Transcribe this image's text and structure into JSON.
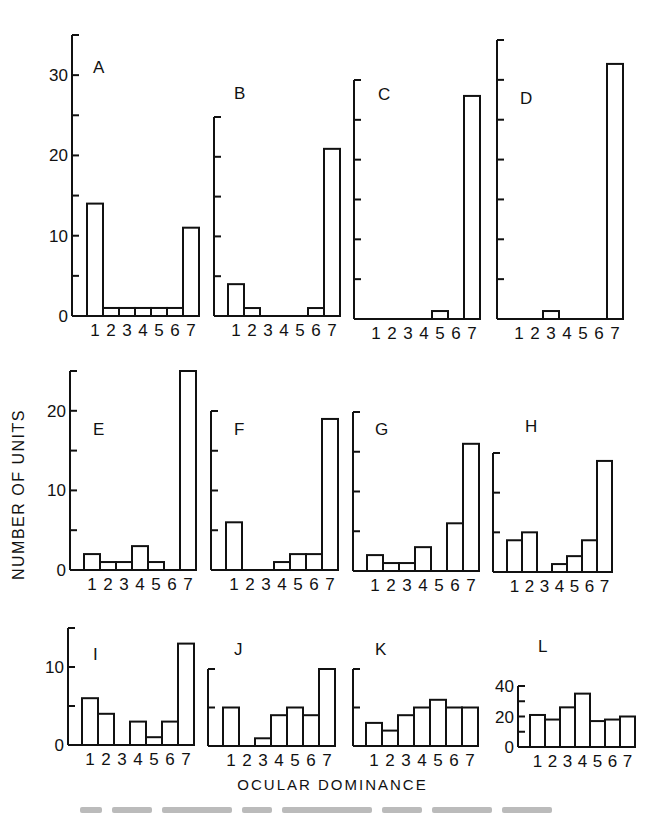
{
  "figure": {
    "y_axis_label": "NUMBER OF UNITS",
    "x_axis_label": "OCULAR DOMINANCE",
    "bar_fill": "#ffffff",
    "stroke": "#111111"
  },
  "chart_data": [
    {
      "panel": "A",
      "type": "bar",
      "categories": [
        "1",
        "2",
        "3",
        "4",
        "5",
        "6",
        "7"
      ],
      "values": [
        14,
        1,
        1,
        1,
        1,
        1,
        11
      ],
      "ylim": [
        0,
        35
      ],
      "yticks": [
        0,
        5,
        10,
        15,
        20,
        25,
        30,
        35
      ],
      "ytick_labels": [
        "0",
        "10",
        "20",
        "30"
      ],
      "xlabel": "OCULAR DOMINANCE",
      "ylabel": "NUMBER OF UNITS",
      "grid": false
    },
    {
      "panel": "B",
      "type": "bar",
      "categories": [
        "1",
        "2",
        "3",
        "4",
        "5",
        "6",
        "7"
      ],
      "values": [
        4,
        1,
        0,
        0,
        0,
        1,
        21
      ],
      "ylim": [
        0,
        25
      ],
      "yticks": [
        0,
        5,
        10,
        15,
        20,
        25
      ],
      "ytick_labels": [],
      "grid": false
    },
    {
      "panel": "C",
      "type": "bar",
      "categories": [
        "1",
        "2",
        "3",
        "4",
        "5",
        "6",
        "7"
      ],
      "values": [
        0,
        0,
        0,
        0,
        1,
        0,
        28
      ],
      "ylim": [
        0,
        30
      ],
      "yticks": [
        0,
        5,
        10,
        15,
        20,
        25,
        30
      ],
      "ytick_labels": [],
      "grid": false
    },
    {
      "panel": "D",
      "type": "bar",
      "categories": [
        "1",
        "2",
        "3",
        "4",
        "5",
        "6",
        "7"
      ],
      "values": [
        0,
        0,
        1,
        0,
        0,
        0,
        32
      ],
      "ylim": [
        0,
        35
      ],
      "yticks": [
        0,
        5,
        10,
        15,
        20,
        25,
        30,
        35
      ],
      "ytick_labels": [],
      "grid": false
    },
    {
      "panel": "E",
      "type": "bar",
      "categories": [
        "1",
        "2",
        "3",
        "4",
        "5",
        "6",
        "7"
      ],
      "values": [
        2,
        1,
        1,
        3,
        1,
        0,
        25
      ],
      "ylim": [
        0,
        25
      ],
      "yticks": [
        0,
        5,
        10,
        15,
        20,
        25
      ],
      "ytick_labels": [
        "0",
        "10",
        "20"
      ],
      "grid": false
    },
    {
      "panel": "F",
      "type": "bar",
      "categories": [
        "1",
        "2",
        "3",
        "4",
        "5",
        "6",
        "7"
      ],
      "values": [
        6,
        0,
        0,
        1,
        2,
        2,
        19
      ],
      "ylim": [
        0,
        20
      ],
      "yticks": [
        0,
        5,
        10,
        15,
        20
      ],
      "ytick_labels": [],
      "grid": false
    },
    {
      "panel": "G",
      "type": "bar",
      "categories": [
        "1",
        "2",
        "3",
        "4",
        "5",
        "6",
        "7"
      ],
      "values": [
        2,
        1,
        1,
        3,
        0,
        6,
        16
      ],
      "ylim": [
        0,
        20
      ],
      "yticks": [
        0,
        5,
        10,
        15,
        20
      ],
      "ytick_labels": [],
      "grid": false
    },
    {
      "panel": "H",
      "type": "bar",
      "categories": [
        "1",
        "2",
        "3",
        "4",
        "5",
        "6",
        "7"
      ],
      "values": [
        4,
        5,
        0,
        1,
        2,
        4,
        14
      ],
      "ylim": [
        0,
        15
      ],
      "yticks": [
        0,
        5,
        10,
        15
      ],
      "ytick_labels": [],
      "grid": false
    },
    {
      "panel": "I",
      "type": "bar",
      "categories": [
        "1",
        "2",
        "3",
        "4",
        "5",
        "6",
        "7"
      ],
      "values": [
        6,
        4,
        0,
        3,
        1,
        3,
        13
      ],
      "ylim": [
        0,
        15
      ],
      "yticks": [
        0,
        5,
        10,
        15
      ],
      "ytick_labels": [
        "0",
        "10"
      ],
      "grid": false
    },
    {
      "panel": "J",
      "type": "bar",
      "categories": [
        "1",
        "2",
        "3",
        "4",
        "5",
        "6",
        "7"
      ],
      "values": [
        5,
        0,
        1,
        4,
        5,
        4,
        10
      ],
      "ylim": [
        0,
        10
      ],
      "yticks": [
        0,
        5,
        10
      ],
      "ytick_labels": [],
      "grid": false
    },
    {
      "panel": "K",
      "type": "bar",
      "categories": [
        "1",
        "2",
        "3",
        "4",
        "5",
        "6",
        "7"
      ],
      "values": [
        3,
        2,
        4,
        5,
        6,
        5,
        5
      ],
      "ylim": [
        0,
        10
      ],
      "yticks": [
        0,
        5,
        10
      ],
      "ytick_labels": [],
      "grid": false
    },
    {
      "panel": "L",
      "type": "bar",
      "categories": [
        "1",
        "2",
        "3",
        "4",
        "5",
        "6",
        "7"
      ],
      "values": [
        21,
        18,
        26,
        35,
        17,
        18,
        20
      ],
      "ylim": [
        0,
        40
      ],
      "yticks": [
        0,
        10,
        20,
        30,
        40
      ],
      "ytick_labels": [
        "0",
        "20",
        "40"
      ],
      "grid": false
    }
  ],
  "layout": [
    {
      "axis_x": 72,
      "base_y": 316,
      "top_y": 35,
      "label_x": 93,
      "label_y": 73,
      "bar_x0": 87,
      "bar_w": 16,
      "ticklabel_step": 10
    },
    {
      "axis_x": 214,
      "base_y": 316,
      "top_y": 117,
      "label_x": 234,
      "label_y": 99,
      "bar_x0": 228,
      "bar_w": 16,
      "ticklabel_step": 0
    },
    {
      "axis_x": 354,
      "base_y": 319,
      "top_y": 80,
      "label_x": 378,
      "label_y": 100,
      "bar_x0": 368,
      "bar_w": 16,
      "ticklabel_step": 0
    },
    {
      "axis_x": 497,
      "base_y": 319,
      "top_y": 40,
      "label_x": 520,
      "label_y": 104,
      "bar_x0": 511,
      "bar_w": 16,
      "ticklabel_step": 0
    },
    {
      "axis_x": 70,
      "base_y": 570,
      "top_y": 371,
      "label_x": 93,
      "label_y": 435,
      "bar_x0": 84,
      "bar_w": 16,
      "ticklabel_step": 10
    },
    {
      "axis_x": 211,
      "base_y": 570,
      "top_y": 411,
      "label_x": 234,
      "label_y": 435,
      "bar_x0": 226,
      "bar_w": 16,
      "ticklabel_step": 0
    },
    {
      "axis_x": 353,
      "base_y": 571,
      "top_y": 412,
      "label_x": 375,
      "label_y": 435,
      "bar_x0": 367,
      "bar_w": 16,
      "ticklabel_step": 0
    },
    {
      "axis_x": 493,
      "base_y": 572,
      "top_y": 453,
      "label_x": 525,
      "label_y": 432,
      "bar_x0": 507,
      "bar_w": 15,
      "ticklabel_step": 0
    },
    {
      "axis_x": 68,
      "base_y": 745,
      "top_y": 628,
      "label_x": 93,
      "label_y": 660,
      "bar_x0": 82,
      "bar_w": 16,
      "ticklabel_step": 10
    },
    {
      "axis_x": 208,
      "base_y": 746,
      "top_y": 669,
      "label_x": 234,
      "label_y": 655,
      "bar_x0": 223,
      "bar_w": 16,
      "ticklabel_step": 0
    },
    {
      "axis_x": 353,
      "base_y": 746,
      "top_y": 669,
      "label_x": 375,
      "label_y": 655,
      "bar_x0": 366,
      "bar_w": 16,
      "ticklabel_step": 0
    },
    {
      "axis_x": 518,
      "base_y": 747,
      "top_y": 686,
      "label_x": 538,
      "label_y": 652,
      "bar_x0": 530,
      "bar_w": 15,
      "ticklabel_step": 20
    }
  ]
}
